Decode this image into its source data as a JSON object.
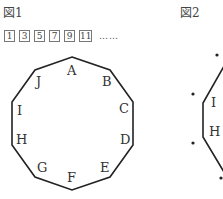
{
  "figure1": {
    "title": "図1",
    "sequence": [
      "1",
      "3",
      "5",
      "7",
      "9",
      "11"
    ],
    "ellipsis": "……",
    "shape": "decagon",
    "vertex_labels": [
      "A",
      "B",
      "C",
      "D",
      "E",
      "F",
      "G",
      "H",
      "I",
      "J"
    ]
  },
  "figure2": {
    "title": "図2",
    "vertex_labels": [
      "I",
      "H"
    ],
    "dot_count": 4
  },
  "colors": {
    "line": "#222222",
    "text": "#333333",
    "box_border": "#777777"
  }
}
